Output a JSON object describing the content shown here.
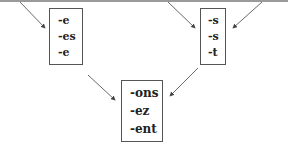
{
  "diagram": {
    "boxes": {
      "left": {
        "items": [
          "-e",
          "-es",
          "-e"
        ]
      },
      "right": {
        "items": [
          "-s",
          "-s",
          "-t"
        ]
      },
      "bottom": {
        "items": [
          "-ons",
          "-ez",
          "-ent"
        ]
      }
    },
    "arrows": [
      {
        "from": "top-left",
        "to": "box-left"
      },
      {
        "from": "top-middle",
        "to": "box-right"
      },
      {
        "from": "top-right",
        "to": "box-right"
      },
      {
        "from": "box-left",
        "to": "box-bottom"
      },
      {
        "from": "box-right",
        "to": "box-bottom"
      }
    ],
    "colors": {
      "line": "#444444",
      "border": "#555555",
      "text": "#222222",
      "top_rule": "#9a9a9a"
    }
  }
}
